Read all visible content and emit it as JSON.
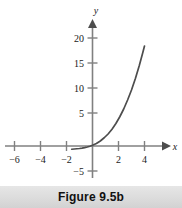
{
  "figure": {
    "caption": "Figure 9.5b"
  },
  "chart_data": {
    "type": "line",
    "title": "",
    "xlabel": "x",
    "ylabel": "y",
    "xlim": [
      -6.8,
      5.6
    ],
    "ylim": [
      -6.5,
      22.5
    ],
    "grid": false,
    "legend": null,
    "x_ticks": [
      -6,
      -4,
      -2,
      2,
      4
    ],
    "x_tick_labels": [
      "−6",
      "−4",
      "−2",
      "2",
      "4"
    ],
    "y_ticks": [
      -5,
      5,
      10,
      15,
      20
    ],
    "y_tick_labels": [
      "−5",
      "5",
      "10",
      "15",
      "20"
    ],
    "axis_color": "#808080",
    "curve_color": "#4d4d4d",
    "series": [
      {
        "name": "exponential curve",
        "x": [
          -1.6,
          -1.4,
          -1.2,
          -1.0,
          -0.8,
          -0.6,
          -0.4,
          -0.2,
          0.0,
          0.3,
          0.6,
          0.9,
          1.2,
          1.5,
          1.8,
          2.1,
          2.4,
          2.7,
          3.0,
          3.3,
          3.6,
          3.85,
          4.0
        ],
        "y": [
          -0.65,
          -0.6,
          -0.55,
          -0.5,
          -0.42,
          -0.32,
          -0.2,
          -0.05,
          0.15,
          0.5,
          1.0,
          1.65,
          2.4,
          3.35,
          4.5,
          5.85,
          7.4,
          9.2,
          11.2,
          13.5,
          16.1,
          18.5,
          20.0
        ]
      }
    ]
  }
}
